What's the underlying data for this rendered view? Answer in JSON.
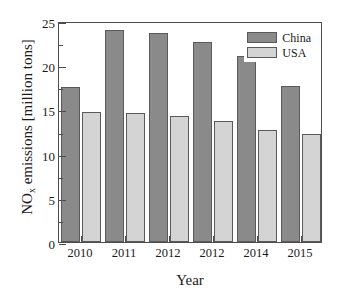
{
  "chart_data": {
    "type": "bar",
    "title": "",
    "xlabel": "Year",
    "ylabel_prefix": "NO",
    "ylabel_sub": "x",
    "ylabel_suffix": " emissions [million tons]",
    "categories": [
      "2010",
      "2011",
      "2012",
      "2012",
      "2014",
      "2015"
    ],
    "series": [
      {
        "name": "China",
        "color": "#8a8a8a",
        "values": [
          17.5,
          24.0,
          23.6,
          22.6,
          21.0,
          17.7
        ]
      },
      {
        "name": "USA",
        "color": "#d4d4d4",
        "values": [
          14.75,
          14.6,
          14.2,
          13.7,
          12.7,
          12.25
        ]
      }
    ],
    "ylim": [
      0,
      25
    ],
    "ytick_labels": [
      "0",
      "5",
      "10",
      "15",
      "20",
      "25"
    ],
    "ytick_values": [
      0,
      5,
      10,
      15,
      20,
      25
    ],
    "yminor_values": [
      2.5,
      7.5,
      12.5,
      17.5,
      22.5
    ],
    "grid": false,
    "legend_position": "top-right",
    "frame_color": "#4d4d4d"
  }
}
